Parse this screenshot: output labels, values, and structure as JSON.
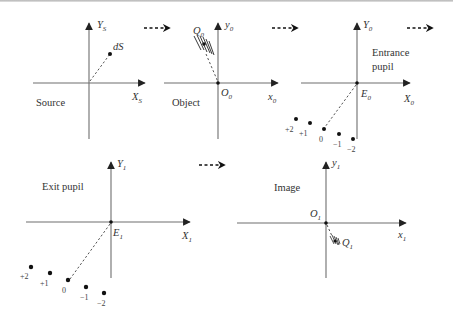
{
  "panels": {
    "source": {
      "caption": "Source",
      "x_axis": "X",
      "x_sub": "S",
      "y_axis": "Y",
      "y_sub": "S",
      "point_label": "dS"
    },
    "object": {
      "caption": "Object",
      "x_axis": "x",
      "x_sub": "0",
      "y_axis": "y",
      "y_sub": "0",
      "origin_label": "O",
      "origin_sub": "0",
      "point_label": "Q",
      "point_sub": "0"
    },
    "entrance_pupil": {
      "caption_line1": "Entrance",
      "caption_line2": "pupil",
      "x_axis": "X",
      "x_sub": "0",
      "y_axis": "Y",
      "y_sub": "0",
      "origin_label": "E",
      "origin_sub": "0",
      "orders": [
        "+2",
        "+1",
        "0",
        "−1",
        "−2"
      ]
    },
    "exit_pupil": {
      "caption": "Exit pupil",
      "x_axis": "X",
      "x_sub": "1",
      "y_axis": "Y",
      "y_sub": "1",
      "origin_label": "E",
      "origin_sub": "1",
      "orders": [
        "+2",
        "+1",
        "0",
        "−1",
        "−2"
      ]
    },
    "image": {
      "caption": "Image",
      "x_axis": "x",
      "x_sub": "1",
      "y_axis": "y",
      "y_sub": "1",
      "origin_label": "O",
      "origin_sub": "1",
      "point_label": "Q",
      "point_sub": "1"
    }
  },
  "flow_arrows": [
    "source-to-object",
    "object-to-entrance-pupil",
    "entrance-pupil-to-exit-pupil",
    "exit-pupil-to-image"
  ]
}
